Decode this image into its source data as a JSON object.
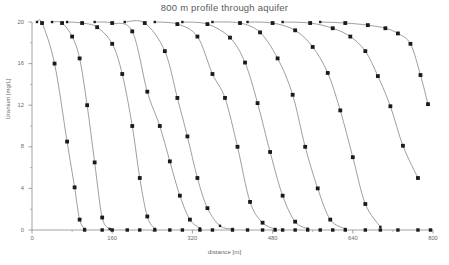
{
  "figure": {
    "title": "800 m profile through aquifer",
    "footer_caption": "",
    "background": "#ffffff",
    "line_color": "#6b6b6b",
    "marker_color": "#1a1a1a",
    "axis_color": "#8a8a8a",
    "text_color": "#5a5a5a"
  },
  "axes": {
    "x": {
      "label": "distance [m]",
      "ticks": [
        0,
        160,
        320,
        480,
        640,
        800
      ],
      "tick_labels": [
        "0",
        "160",
        "320",
        "480",
        "640",
        "800"
      ],
      "min": 0,
      "max": 800,
      "minor_ticks": [
        80,
        240,
        400,
        560,
        720
      ]
    },
    "y": {
      "label": "Uranium [mg/L]",
      "ticks": [
        0,
        4,
        8,
        12,
        16,
        20
      ],
      "tick_labels": [
        "0",
        "4",
        "8",
        "12",
        "16",
        "20"
      ],
      "min": 0,
      "max": 20,
      "minor_ticks": [
        2,
        6,
        10,
        14,
        18
      ]
    },
    "grid": false,
    "legend": "none"
  },
  "chart_data": {
    "type": "line",
    "title": "800 m profile through aquifer",
    "xlabel": "distance [m]",
    "ylabel": "Uranium [mg/L]",
    "xlim": [
      0,
      800
    ],
    "ylim": [
      0,
      20
    ],
    "grid": false,
    "legend_position": "none",
    "series": [
      {
        "name": "profile 1",
        "x": [
          10,
          20,
          45,
          70,
          85,
          95,
          105
        ],
        "y": [
          20.0,
          19.9,
          16.0,
          8.5,
          4.1,
          1.0,
          0.1
        ]
      },
      {
        "name": "profile 2",
        "x": [
          40,
          60,
          80,
          95,
          110,
          125,
          140,
          155
        ],
        "y": [
          20.0,
          19.9,
          18.6,
          16.5,
          12.0,
          6.5,
          1.2,
          0.1
        ]
      },
      {
        "name": "profile 3",
        "x": [
          70,
          100,
          130,
          160,
          180,
          200,
          215,
          230,
          245
        ],
        "y": [
          20.0,
          19.9,
          19.5,
          17.9,
          15.0,
          10.0,
          5.0,
          1.3,
          0.1
        ]
      },
      {
        "name": "profile 4",
        "x": [
          125,
          160,
          200,
          230,
          255,
          275,
          295,
          315,
          335
        ],
        "y": [
          20.0,
          19.9,
          19.1,
          13.3,
          10.0,
          6.6,
          3.3,
          1.0,
          0.15
        ]
      },
      {
        "name": "profile 5",
        "x": [
          185,
          225,
          265,
          290,
          310,
          330,
          350,
          375,
          400
        ],
        "y": [
          20.0,
          19.9,
          17.2,
          12.7,
          9.0,
          5.0,
          2.1,
          0.4,
          0.1
        ]
      },
      {
        "name": "profile 6",
        "x": [
          245,
          290,
          330,
          360,
          385,
          410,
          435,
          460,
          485
        ],
        "y": [
          20.0,
          19.8,
          18.6,
          15.0,
          12.7,
          8.0,
          2.7,
          0.7,
          0.1
        ]
      },
      {
        "name": "profile 7",
        "x": [
          300,
          350,
          395,
          425,
          450,
          475,
          500,
          525,
          550
        ],
        "y": [
          20.0,
          19.8,
          18.5,
          16.1,
          12.2,
          7.5,
          3.3,
          0.8,
          0.12
        ]
      },
      {
        "name": "profile 8",
        "x": [
          360,
          415,
          455,
          490,
          520,
          545,
          570,
          595,
          625
        ],
        "y": [
          20.0,
          19.9,
          19.0,
          16.5,
          13.0,
          8.0,
          4.0,
          1.0,
          0.1
        ]
      },
      {
        "name": "profile 9",
        "x": [
          430,
          480,
          525,
          560,
          590,
          615,
          640,
          665,
          695
        ],
        "y": [
          20.0,
          19.9,
          19.2,
          17.6,
          15.1,
          11.5,
          7.0,
          2.5,
          0.3
        ]
      },
      {
        "name": "profile 10",
        "x": [
          500,
          555,
          600,
          635,
          665,
          690,
          715,
          740,
          770
        ],
        "y": [
          20.0,
          19.9,
          19.4,
          18.6,
          17.2,
          14.8,
          11.9,
          8.1,
          5.0
        ]
      },
      {
        "name": "profile 11",
        "x": [
          575,
          625,
          670,
          705,
          730,
          755,
          775,
          790
        ],
        "y": [
          20.0,
          19.9,
          19.7,
          19.4,
          18.9,
          17.9,
          14.9,
          12.1
        ]
      }
    ],
    "baseline_markers": {
      "y": 0,
      "x": [
        105,
        140,
        160,
        190,
        215,
        245,
        275,
        300,
        335,
        360,
        400,
        430,
        460,
        485,
        500,
        525,
        550,
        575,
        600,
        625,
        665,
        695,
        730,
        770,
        795
      ]
    }
  }
}
